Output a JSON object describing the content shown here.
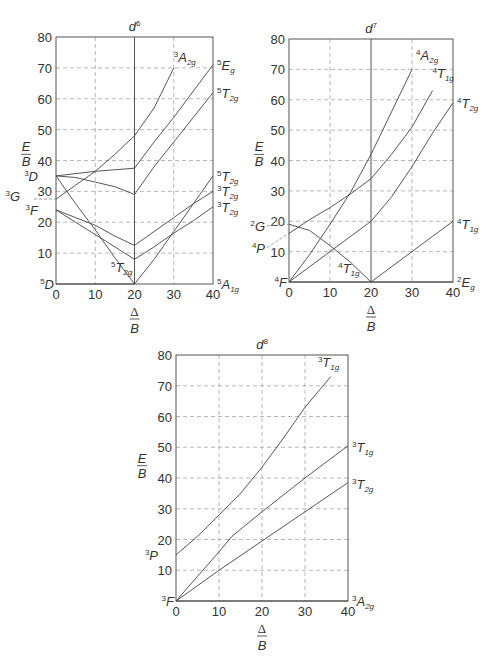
{
  "chart_data": [
    {
      "type": "line",
      "title": "d6",
      "title_sup": "6",
      "xlabel": "Δ/B",
      "ylabel": "E/B",
      "xlim": [
        0,
        40
      ],
      "ylim": [
        0,
        80
      ],
      "xticks": [
        0,
        10,
        20,
        30,
        40
      ],
      "yticks": [
        10,
        20,
        30,
        40,
        50,
        60,
        70,
        80
      ],
      "grid": true,
      "vertical_divider_x": 20,
      "frame_px": {
        "left": 56,
        "right": 213,
        "top": 37,
        "bottom": 284
      },
      "left_terms": [
        {
          "label": "D",
          "sup": "5",
          "sub": "",
          "y": 0
        },
        {
          "label": "F",
          "sup": "3",
          "sub": "",
          "y": 24
        },
        {
          "label": "G",
          "sup": "3",
          "sub": "",
          "y": 27.5
        },
        {
          "label": "D",
          "sup": "3",
          "sub": "",
          "y": 35
        }
      ],
      "right_terms": [
        {
          "label": "A",
          "sup": "5",
          "sub": "1g",
          "y": 0
        },
        {
          "label": "T",
          "sup": "3",
          "sub": "2g",
          "y": 25
        },
        {
          "label": "T",
          "sup": "3",
          "sub": "2g",
          "y": 30
        },
        {
          "label": "T",
          "sup": "5",
          "sub": "2g",
          "y": 35
        },
        {
          "label": "T",
          "sup": "5",
          "sub": "2g",
          "y": 62
        },
        {
          "label": "E",
          "sup": "5",
          "sub": "g",
          "y": 71
        }
      ],
      "inner_terms": [
        {
          "label": "A",
          "sup": "3",
          "sub": "2g",
          "x": 30,
          "y": 72
        },
        {
          "label": "T",
          "sup": "5",
          "sub": "2g",
          "x": 14,
          "y": 4
        }
      ],
      "series": [
        {
          "name": "5T2g (ground, high spin)",
          "points": [
            [
              0,
              0
            ],
            [
              20,
              0
            ]
          ]
        },
        {
          "name": "3D→1A1g crossing",
          "points": [
            [
              0,
              35
            ],
            [
              5,
              26
            ],
            [
              10,
              17.5
            ],
            [
              15,
              8.5
            ],
            [
              20,
              0
            ]
          ]
        },
        {
          "name": "5T2g (right)",
          "points": [
            [
              20,
              0
            ],
            [
              25,
              8
            ],
            [
              30,
              17
            ],
            [
              35,
              26
            ],
            [
              40,
              35
            ]
          ]
        },
        {
          "name": "3D→upper",
          "points": [
            [
              0,
              35
            ],
            [
              5,
              34.5
            ],
            [
              10,
              33
            ],
            [
              15,
              31.5
            ],
            [
              20,
              29
            ],
            [
              25,
              38
            ],
            [
              30,
              46
            ],
            [
              35,
              54
            ],
            [
              40,
              62
            ]
          ]
        },
        {
          "name": "5Eg",
          "points": [
            [
              0,
              35
            ],
            [
              10,
              36.5
            ],
            [
              20,
              37.5
            ],
            [
              25,
              46
            ],
            [
              30,
              54
            ],
            [
              35,
              62.5
            ],
            [
              40,
              71
            ]
          ]
        },
        {
          "name": "3A2g",
          "points": [
            [
              0,
              27.5
            ],
            [
              5,
              32
            ],
            [
              10,
              36.5
            ],
            [
              15,
              42
            ],
            [
              20,
              48
            ],
            [
              25,
              57
            ],
            [
              30,
              70
            ]
          ]
        },
        {
          "name": "3T2g upper",
          "points": [
            [
              0,
              24
            ],
            [
              5,
              21.5
            ],
            [
              10,
              19
            ],
            [
              15,
              15.5
            ],
            [
              20,
              12.5
            ],
            [
              25,
              17
            ],
            [
              30,
              21.5
            ],
            [
              35,
              26
            ],
            [
              40,
              30
            ]
          ]
        },
        {
          "name": "3T2g lower",
          "points": [
            [
              0,
              24
            ],
            [
              5,
              20
            ],
            [
              10,
              16
            ],
            [
              15,
              12
            ],
            [
              20,
              8
            ],
            [
              25,
              12
            ],
            [
              30,
              16.5
            ],
            [
              35,
              20.5
            ],
            [
              40,
              25
            ]
          ]
        }
      ]
    },
    {
      "type": "line",
      "title": "d7",
      "title_sup": "7",
      "xlabel": "Δ/B",
      "ylabel": "E/B",
      "xlim": [
        0,
        40
      ],
      "ylim": [
        0,
        80
      ],
      "xticks": [
        0,
        10,
        20,
        30,
        40
      ],
      "yticks": [
        10,
        20,
        30,
        40,
        50,
        60,
        70,
        80
      ],
      "grid": true,
      "vertical_divider_x": 20,
      "frame_px": {
        "left": 289,
        "right": 453,
        "top": 39,
        "bottom": 282
      },
      "left_terms": [
        {
          "label": "F",
          "sup": "4",
          "sub": "",
          "y": 0
        },
        {
          "label": "P",
          "sup": "4",
          "sub": "",
          "y": 13
        },
        {
          "label": "G",
          "sup": "2",
          "sub": "",
          "y": 17.5
        }
      ],
      "right_terms": [
        {
          "label": "E",
          "sup": "2",
          "sub": "g",
          "y": 0
        },
        {
          "label": "T",
          "sup": "4",
          "sub": "1g",
          "y": 19
        },
        {
          "label": "T",
          "sup": "4",
          "sub": "2g",
          "y": 59
        }
      ],
      "inner_terms": [
        {
          "label": "A",
          "sup": "4",
          "sub": "2g",
          "x": 31,
          "y": 73
        },
        {
          "label": "T",
          "sup": "4",
          "sub": "1g",
          "x": 35,
          "y": 67
        },
        {
          "label": "T",
          "sup": "4",
          "sub": "1g",
          "x": 12,
          "y": 3
        }
      ],
      "series": [
        {
          "name": "4T1g (ground left)",
          "points": [
            [
              0,
              0
            ],
            [
              20,
              0
            ]
          ]
        },
        {
          "name": "4T2g",
          "points": [
            [
              0,
              0
            ],
            [
              10,
              10
            ],
            [
              20,
              20
            ],
            [
              25,
              28
            ],
            [
              30,
              38
            ],
            [
              35,
              49
            ],
            [
              40,
              59
            ]
          ]
        },
        {
          "name": "4A2g",
          "points": [
            [
              0,
              0
            ],
            [
              5,
              9
            ],
            [
              10,
              19
            ],
            [
              15,
              29.5
            ],
            [
              20,
              42
            ],
            [
              25,
              56
            ],
            [
              30,
              70
            ]
          ]
        },
        {
          "name": "4T1g (4P)",
          "points": [
            [
              0,
              16
            ],
            [
              5,
              20.5
            ],
            [
              10,
              24.5
            ],
            [
              15,
              29
            ],
            [
              20,
              34
            ],
            [
              25,
              42
            ],
            [
              30,
              51
            ],
            [
              35,
              63
            ]
          ]
        },
        {
          "name": "2G→2Eg",
          "points": [
            [
              0,
              19
            ],
            [
              5,
              17
            ],
            [
              10,
              12
            ],
            [
              15,
              6.5
            ],
            [
              20,
              0
            ]
          ]
        },
        {
          "name": "2Eg (ground right)",
          "points": [
            [
              20,
              0
            ],
            [
              40,
              0
            ]
          ]
        },
        {
          "name": "4T1g (right)",
          "points": [
            [
              20,
              0
            ],
            [
              25,
              5
            ],
            [
              30,
              10
            ],
            [
              35,
              15
            ],
            [
              40,
              20
            ]
          ]
        }
      ]
    },
    {
      "type": "line",
      "title": "d8",
      "title_sup": "8",
      "xlabel": "Δ/B",
      "ylabel": "E/B",
      "xlim": [
        0,
        40
      ],
      "ylim": [
        0,
        80
      ],
      "xticks": [
        0,
        10,
        20,
        30,
        40
      ],
      "yticks": [
        10,
        20,
        30,
        40,
        50,
        60,
        70,
        80
      ],
      "grid": true,
      "vertical_divider_x": null,
      "frame_px": {
        "left": 176,
        "right": 348,
        "top": 355,
        "bottom": 601
      },
      "left_terms": [
        {
          "label": "F",
          "sup": "3",
          "sub": "",
          "y": 0
        },
        {
          "label": "P",
          "sup": "3",
          "sub": "",
          "y": 15
        }
      ],
      "right_terms": [
        {
          "label": "A",
          "sup": "3",
          "sub": "2g",
          "y": 0
        },
        {
          "label": "T",
          "sup": "3",
          "sub": "2g",
          "y": 38
        },
        {
          "label": "T",
          "sup": "3",
          "sub": "1g",
          "y": 50
        }
      ],
      "inner_terms": [
        {
          "label": "T",
          "sup": "3",
          "sub": "1g",
          "x": 33,
          "y": 76
        }
      ],
      "series": [
        {
          "name": "3A2g (ground)",
          "points": [
            [
              0,
              0
            ],
            [
              40,
              0
            ]
          ]
        },
        {
          "name": "3T2g",
          "points": [
            [
              0,
              0
            ],
            [
              10,
              10
            ],
            [
              20,
              19.5
            ],
            [
              30,
              29
            ],
            [
              40,
              38.5
            ]
          ]
        },
        {
          "name": "3T1g (3F)",
          "points": [
            [
              0,
              0
            ],
            [
              5,
              8
            ],
            [
              10,
              16
            ],
            [
              13,
              21
            ],
            [
              20,
              29
            ],
            [
              30,
              40
            ],
            [
              40,
              50.5
            ]
          ]
        },
        {
          "name": "3T1g (3P)",
          "points": [
            [
              0,
              15
            ],
            [
              5,
              21
            ],
            [
              10,
              28
            ],
            [
              15,
              35
            ],
            [
              20,
              43.5
            ],
            [
              25,
              53
            ],
            [
              30,
              63
            ],
            [
              36,
              73
            ]
          ]
        }
      ]
    }
  ]
}
